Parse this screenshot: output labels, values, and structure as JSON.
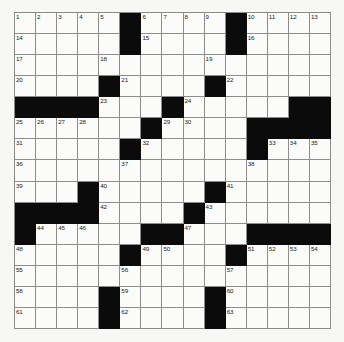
{
  "puzzle": {
    "title": "Crossword Grid",
    "rows": 15,
    "columns": 15,
    "cell_colors": {
      "open": "#fbfbf9",
      "block": "#0b0b0b",
      "grid_line": "#8d8d8d",
      "background": "#f7f7f5",
      "number_text": "#1a1a1a"
    },
    "highest_clue_number": 63,
    "grid": [
      [
        "1",
        "2",
        "3",
        "4",
        "5",
        "#",
        "6",
        "7",
        "8",
        "9",
        "#",
        "10",
        "11",
        "12",
        "13"
      ],
      [
        "14",
        "",
        "",
        "",
        "",
        "#",
        "15",
        "",
        "",
        "",
        "#",
        "16",
        "",
        "",
        ""
      ],
      [
        "17",
        "",
        "",
        "",
        "18",
        "",
        "",
        "",
        "",
        "19",
        "",
        "",
        "",
        "",
        ""
      ],
      [
        "20",
        "",
        "",
        "",
        "#",
        "21",
        "",
        "",
        "",
        "#",
        "22",
        "",
        "",
        "",
        ""
      ],
      [
        "#",
        "#",
        "#",
        "#",
        "23",
        "",
        "",
        "#",
        "24",
        "",
        "",
        "",
        "",
        "#",
        "#"
      ],
      [
        "25",
        "26",
        "27",
        "28",
        "",
        "",
        "#",
        "29",
        "30",
        "",
        "",
        "#",
        "#",
        "#",
        "#"
      ],
      [
        "31",
        "",
        "",
        "",
        "",
        "#",
        "32",
        "",
        "",
        "",
        "",
        "#",
        "33",
        "34",
        "35"
      ],
      [
        "36",
        "",
        "",
        "",
        "",
        "37",
        "",
        "",
        "",
        "",
        "",
        "38",
        "",
        "",
        ""
      ],
      [
        "39",
        "",
        "",
        "#",
        "40",
        "",
        "",
        "",
        "",
        "#",
        "41",
        "",
        "",
        "",
        ""
      ],
      [
        "#",
        "#",
        "#",
        "#",
        "42",
        "",
        "",
        "",
        "#",
        "43",
        "",
        "",
        "",
        "",
        ""
      ],
      [
        "#",
        "44",
        "45",
        "46",
        "",
        "",
        "#",
        "#",
        "47",
        "",
        "",
        "#",
        "#",
        "#",
        "#"
      ],
      [
        "48",
        "",
        "",
        "",
        "",
        "#",
        "49",
        "50",
        "",
        "",
        "#",
        "51",
        "52",
        "53",
        "54"
      ],
      [
        "55",
        "",
        "",
        "",
        "",
        "56",
        "",
        "",
        "",
        "",
        "57",
        "",
        "",
        "",
        ""
      ],
      [
        "58",
        "",
        "",
        "",
        "#",
        "59",
        "",
        "",
        "",
        "#",
        "60",
        "",
        "",
        "",
        ""
      ],
      [
        "61",
        "",
        "",
        "",
        "#",
        "62",
        "",
        "",
        "",
        "#",
        "63",
        "",
        "",
        "",
        ""
      ]
    ],
    "blocks": [
      [
        0,
        5
      ],
      [
        0,
        10
      ],
      [
        1,
        5
      ],
      [
        1,
        10
      ],
      [
        3,
        4
      ],
      [
        3,
        9
      ],
      [
        4,
        0
      ],
      [
        4,
        1
      ],
      [
        4,
        2
      ],
      [
        4,
        3
      ],
      [
        4,
        7
      ],
      [
        4,
        13
      ],
      [
        4,
        14
      ],
      [
        5,
        6
      ],
      [
        5,
        11
      ],
      [
        5,
        12
      ],
      [
        5,
        13
      ],
      [
        5,
        14
      ],
      [
        6,
        5
      ],
      [
        6,
        11
      ],
      [
        8,
        3
      ],
      [
        8,
        9
      ],
      [
        9,
        0
      ],
      [
        9,
        1
      ],
      [
        9,
        2
      ],
      [
        9,
        3
      ],
      [
        9,
        8
      ],
      [
        10,
        0
      ],
      [
        10,
        6
      ],
      [
        10,
        7
      ],
      [
        10,
        11
      ],
      [
        10,
        12
      ],
      [
        10,
        13
      ],
      [
        10,
        14
      ],
      [
        11,
        5
      ],
      [
        11,
        10
      ],
      [
        13,
        4
      ],
      [
        13,
        9
      ],
      [
        14,
        4
      ],
      [
        14,
        9
      ]
    ]
  }
}
